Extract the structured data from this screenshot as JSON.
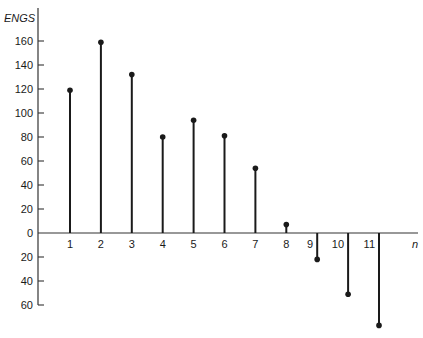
{
  "chart_data": {
    "type": "stem",
    "title": "",
    "ylabel": "ENGS",
    "xlabel": "n",
    "x": [
      1,
      2,
      3,
      4,
      5,
      6,
      7,
      8,
      9,
      10,
      11
    ],
    "values": [
      119,
      159,
      132,
      80,
      94,
      81,
      54,
      7,
      -22,
      -51,
      -77
    ],
    "x_tick_labels": [
      "1",
      "2",
      "3",
      "4",
      "5",
      "6",
      "7",
      "8",
      "9",
      "10",
      "11"
    ],
    "y_ticks": [
      160,
      140,
      120,
      100,
      80,
      60,
      40,
      20,
      0,
      -20,
      -40,
      -60
    ],
    "y_tick_labels": [
      "160",
      "140",
      "120",
      "100",
      "80",
      "60",
      "40",
      "20",
      "0",
      "20",
      "40",
      "60"
    ],
    "ylim": [
      -60,
      160
    ],
    "grid": false,
    "legend": null,
    "colors": {
      "stem": "#1a1a1a",
      "axis": "#333333",
      "background": "#ffffff"
    }
  },
  "layout": {
    "y_axis_x": 38,
    "zero_y": 233,
    "px_per_unit": 1.2,
    "first_stem_x": 70,
    "stem_spacing": 30.9,
    "x_axis_end": 418,
    "y_axis_top": 8
  }
}
